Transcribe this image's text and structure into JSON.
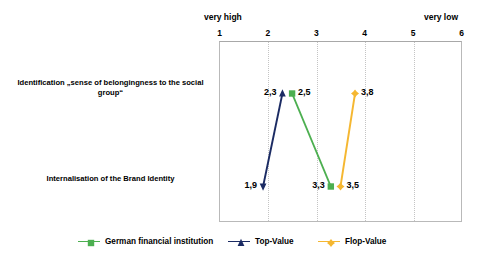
{
  "chart_data": {
    "type": "line",
    "title": "",
    "subtitle": "",
    "xlabel": "",
    "ylabel": "",
    "orientation": "horizontal-slope",
    "grid": true,
    "legend_position": "bottom",
    "xlim": [
      1,
      6
    ],
    "x_ticks": [
      "1",
      "2",
      "3",
      "4",
      "5",
      "6"
    ],
    "x_tick_values": [
      1,
      2,
      3,
      4,
      5,
      6
    ],
    "scale_low_end_caption": "very high",
    "scale_high_end_caption": "very low",
    "categories": [
      "Identification „sense of belongingness to the social group“",
      "Internalisation of the Brand Identity"
    ],
    "series": [
      {
        "name": "German financial institution",
        "color": "#4caf50",
        "marker": "square",
        "values": [
          2.5,
          3.3
        ],
        "value_labels": [
          "2,5",
          "3,3"
        ]
      },
      {
        "name": "Top-Value",
        "color": "#1b2b63",
        "marker": "triangle",
        "values": [
          2.3,
          1.9
        ],
        "value_labels": [
          "2,3",
          "1,9"
        ]
      },
      {
        "name": "Flop-Value",
        "color": "#f5b731",
        "marker": "diamond",
        "values": [
          3.8,
          3.5
        ],
        "value_labels": [
          "3,8",
          "3,5"
        ]
      }
    ]
  },
  "axis": {
    "caption_left": "very high",
    "caption_right": "very low",
    "ticks": [
      "1",
      "2",
      "3",
      "4",
      "5",
      "6"
    ]
  },
  "rows": [
    {
      "label": "Identification „sense of belongingness to the social group“"
    },
    {
      "label": "Internalisation of the Brand Identity"
    }
  ],
  "legend": {
    "entries": [
      {
        "label": "German financial institution",
        "color": "#4caf50"
      },
      {
        "label": "Top-Value",
        "color": "#1b2b63"
      },
      {
        "label": "Flop-Value",
        "color": "#f5b731"
      }
    ]
  },
  "point_labels": {
    "top_row": {
      "top_value": "2,3",
      "german_financial_institution": "2,5",
      "flop_value": "3,8"
    },
    "bottom_row": {
      "top_value": "1,9",
      "german_financial_institution": "3,3",
      "flop_value": "3,5"
    }
  }
}
